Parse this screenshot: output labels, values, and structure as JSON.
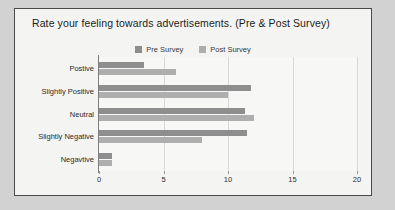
{
  "frame": {
    "border_color": "#4a4a4a",
    "background": "#f4f4f2",
    "mat_color": "#d2d2d2"
  },
  "chart_data": {
    "type": "bar",
    "orientation": "horizontal",
    "title": "Rate your feeling towards advertisements. (Pre & Post Survey)",
    "subtitle": "",
    "xlabel": "",
    "ylabel": "",
    "xlim": [
      0,
      20
    ],
    "xticks": [
      0,
      5,
      10,
      15,
      20
    ],
    "xtick_labels": [
      "0",
      "5",
      "10",
      "15",
      "20"
    ],
    "grid": true,
    "grid_axis": "x",
    "legend_position": "top-center",
    "categories": [
      "Postive",
      "Slightly Positive",
      "Neutral",
      "Slightly Negative",
      "Negavtive"
    ],
    "series": [
      {
        "name": "Pre Survey",
        "color": "#8e8e8e",
        "values": [
          3.5,
          11.8,
          11.3,
          11.5,
          1
        ]
      },
      {
        "name": "Post Survey",
        "color": "#aeaeae",
        "values": [
          6,
          10,
          12,
          8,
          1
        ]
      }
    ]
  }
}
